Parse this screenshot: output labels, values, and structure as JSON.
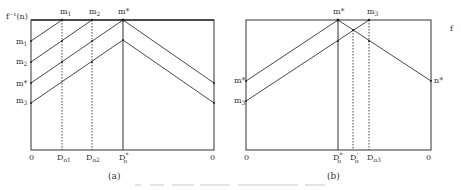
{
  "figure": {
    "caption_faint": "Figure — (caption text illegible)",
    "panels": [
      {
        "id": "a",
        "label": "(a)",
        "y_axis_label": "f⁻¹(n)",
        "top_labels": [
          "m",
          "m",
          "m*"
        ],
        "top_label_subs": [
          "1",
          "2",
          ""
        ],
        "left_labels": [
          "m",
          "m",
          "m*",
          "m"
        ],
        "left_label_subs": [
          "1",
          "2",
          "",
          "3"
        ],
        "bottom_labels": [
          "0",
          "D",
          "D",
          "D",
          "0"
        ],
        "bottom_label_subs": [
          "",
          "o1",
          "o2",
          "o",
          ""
        ],
        "bottom_label_sups": [
          "",
          "",
          "",
          "*",
          ""
        ],
        "verticals": [
          {
            "name": "D_o1",
            "style": "dotted"
          },
          {
            "name": "D_o2",
            "style": "dotted"
          },
          {
            "name": "D*_o",
            "style": "solid"
          }
        ]
      },
      {
        "id": "b",
        "label": "(b)",
        "top_labels": [
          "m*",
          "m"
        ],
        "top_label_subs": [
          "",
          "3"
        ],
        "left_labels": [
          "m*",
          "m"
        ],
        "left_label_subs": [
          "",
          "3"
        ],
        "right_labels": [
          "n*"
        ],
        "right_edge_mark": "f",
        "bottom_labels": [
          "0",
          "D",
          "D",
          "D",
          "0"
        ],
        "bottom_label_subs": [
          "",
          "o",
          "o",
          "o3",
          ""
        ],
        "bottom_label_sups": [
          "",
          "*",
          "'",
          "",
          ""
        ],
        "verticals": [
          {
            "name": "D*_o",
            "style": "solid"
          },
          {
            "name": "D'_o",
            "style": "dotted"
          },
          {
            "name": "D_o3",
            "style": "dotted"
          }
        ]
      }
    ]
  }
}
